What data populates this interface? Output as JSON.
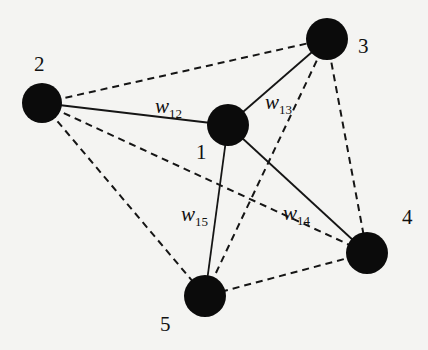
{
  "diagram": {
    "type": "weighted-graph",
    "nodes": [
      {
        "id": "1",
        "label": "1",
        "x": 228,
        "y": 125,
        "r": 21,
        "label_x": 196,
        "label_y": 159
      },
      {
        "id": "2",
        "label": "2",
        "x": 42,
        "y": 103,
        "r": 20,
        "label_x": 34,
        "label_y": 71
      },
      {
        "id": "3",
        "label": "3",
        "x": 327,
        "y": 39,
        "r": 21,
        "label_x": 358,
        "label_y": 53
      },
      {
        "id": "4",
        "label": "4",
        "x": 367,
        "y": 253,
        "r": 21,
        "label_x": 402,
        "label_y": 224
      },
      {
        "id": "5",
        "label": "5",
        "x": 205,
        "y": 296,
        "r": 21,
        "label_x": 160,
        "label_y": 331
      }
    ],
    "edges": [
      {
        "from": "1",
        "to": "2",
        "style": "solid",
        "weight_label": "w",
        "weight_sub": "12",
        "lx": 155,
        "ly": 113
      },
      {
        "from": "1",
        "to": "3",
        "style": "solid",
        "weight_label": "w",
        "weight_sub": "13",
        "lx": 265,
        "ly": 109
      },
      {
        "from": "1",
        "to": "4",
        "style": "solid",
        "weight_label": "w",
        "weight_sub": "14",
        "lx": 283,
        "ly": 220
      },
      {
        "from": "1",
        "to": "5",
        "style": "solid",
        "weight_label": "w",
        "weight_sub": "15",
        "lx": 181,
        "ly": 221
      },
      {
        "from": "2",
        "to": "3",
        "style": "dashed"
      },
      {
        "from": "2",
        "to": "4",
        "style": "dashed"
      },
      {
        "from": "2",
        "to": "5",
        "style": "dashed"
      },
      {
        "from": "3",
        "to": "4",
        "style": "dashed"
      },
      {
        "from": "3",
        "to": "5",
        "style": "dashed"
      },
      {
        "from": "4",
        "to": "5",
        "style": "dashed"
      }
    ],
    "colors": {
      "node": "#0b0b0b",
      "edge": "#151515",
      "background": "#f4f4f2"
    }
  }
}
